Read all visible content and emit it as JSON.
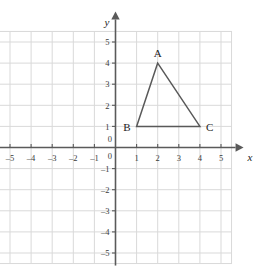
{
  "chart_data": {
    "type": "scatter",
    "title": "",
    "xlabel": "x",
    "ylabel": "y",
    "xlim": [
      -5.5,
      5.5
    ],
    "ylim": [
      -5.5,
      5.5
    ],
    "grid": true,
    "grid_step": 1,
    "legend": "none",
    "x_ticks": [
      -5,
      -4,
      -3,
      -2,
      -1,
      0,
      1,
      2,
      3,
      4,
      5
    ],
    "y_ticks": [
      -5,
      -4,
      -3,
      -2,
      -1,
      0,
      1,
      2,
      3,
      4,
      5
    ],
    "x_tick_labels": [
      "-5",
      "-4",
      "-3",
      "-2",
      "-1",
      "0",
      "1",
      "2",
      "3",
      "4",
      "5"
    ],
    "y_tick_labels": [
      "-5",
      "-4",
      "-3",
      "-2",
      "-1",
      "0",
      "1",
      "2",
      "3",
      "4",
      "5"
    ],
    "origin_label_x": "0",
    "origin_label_y": "0",
    "shapes": [
      {
        "name": "triangle-ABC",
        "kind": "polygon",
        "closed": true,
        "stroke": "#595959",
        "fill": "none",
        "points": [
          {
            "label": "A",
            "x": 2,
            "y": 4
          },
          {
            "label": "B",
            "x": 1,
            "y": 1
          },
          {
            "label": "C",
            "x": 4,
            "y": 1
          }
        ]
      }
    ],
    "point_labels": [
      {
        "label": "A",
        "x": 2,
        "y": 4,
        "anchor": "above"
      },
      {
        "label": "B",
        "x": 1,
        "y": 1,
        "anchor": "left"
      },
      {
        "label": "C",
        "x": 4,
        "y": 1,
        "anchor": "right"
      }
    ]
  },
  "colors": {
    "grid": "#d9d9d9",
    "axis": "#5a5a5a",
    "shape_stroke": "#595959",
    "text": "#1c1c1c",
    "tick_text": "#3a3a3a",
    "background": "#ffffff"
  },
  "axes": {
    "x_name": "x",
    "y_name": "y"
  }
}
